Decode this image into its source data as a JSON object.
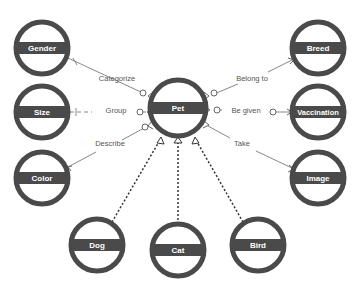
{
  "diagram": {
    "colors": {
      "ring": "#4a4a4a",
      "band": "#4a4a4a",
      "node_label": "#ffffff",
      "edge": "#888888",
      "dashed_edge": "#333333",
      "edge_label": "#555555",
      "background": "#ffffff"
    },
    "nodes": {
      "gender": {
        "label": "Gender",
        "cx": 42,
        "cy": 48
      },
      "size": {
        "label": "Size",
        "cx": 42,
        "cy": 112
      },
      "color": {
        "label": "Color",
        "cx": 42,
        "cy": 178
      },
      "pet": {
        "label": "Pet",
        "cx": 178,
        "cy": 108
      },
      "breed": {
        "label": "Breed",
        "cx": 318,
        "cy": 48
      },
      "vaccination": {
        "label": "Vaccination",
        "cx": 318,
        "cy": 112
      },
      "image": {
        "label": "Image",
        "cx": 318,
        "cy": 178
      },
      "dog": {
        "label": "Dog",
        "cx": 97,
        "cy": 245
      },
      "cat": {
        "label": "Cat",
        "cx": 178,
        "cy": 250
      },
      "bird": {
        "label": "Bird",
        "cx": 258,
        "cy": 245
      }
    },
    "edges": {
      "categorize": {
        "label": "Categorize",
        "from": "Gender",
        "to": "Pet"
      },
      "group": {
        "label": "Group",
        "from": "Size",
        "to": "Pet"
      },
      "describe": {
        "label": "Describe",
        "from": "Color",
        "to": "Pet"
      },
      "belong_to": {
        "label": "Belong to",
        "from": "Pet",
        "to": "Breed"
      },
      "be_given": {
        "label": "Be given",
        "from": "Pet",
        "to": "Vaccination"
      },
      "take": {
        "label": "Take",
        "from": "Pet",
        "to": "Image"
      }
    },
    "inheritance": [
      "Dog",
      "Cat",
      "Bird"
    ]
  }
}
